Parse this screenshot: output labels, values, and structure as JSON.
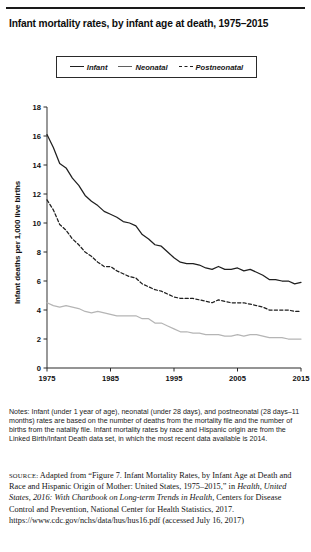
{
  "figure": {
    "title": "Infant mortality rates, by infant age at death, 1975–2015",
    "ylabel": "Infant deaths per 1,000 live births"
  },
  "legend": {
    "items": [
      {
        "label": "Infant",
        "style": "solid",
        "color": "#1f1f1f"
      },
      {
        "label": "Neonatal",
        "style": "solid",
        "color": "#5f5f5f"
      },
      {
        "label": "Postneonatal",
        "style": "dashed",
        "color": "#1f1f1f"
      }
    ]
  },
  "notes": {
    "text": "Notes: Infant (under 1 year of age), neonatal (under 28 days), and postneonatal (28 days–11 months) rates are based on the number of deaths from the mortality file and the number of births from the natality file. Infant mortality rates by race and Hispanic origin are from the Linked Birth/Infant Death data set, in which the most recent data available is 2014."
  },
  "source": {
    "label": "SOURCE:",
    "part1": " Adapted from “Figure 7. Infant Mortality Rates, by Infant Age at Death and Race and Hispanic Origin of Mother: United States, 1975–2015,” in ",
    "italic1": "Health, United States, 2016: With Chartbook on Long-term Trends in Health,",
    "part2": " Centers for Disease Control and Prevention, National Center for Health Statistics, 2017. https://www.cdc.gov/nchs/data/hus/hus16.pdf (accessed July 16, 2017)"
  },
  "chart_data": {
    "type": "line",
    "title": "Infant mortality rates, by infant age at death, 1975–2015",
    "xlabel": "",
    "ylabel": "Infant deaths per 1,000 live births",
    "xlim": [
      1975,
      2015
    ],
    "ylim": [
      0,
      18
    ],
    "ytick_labels": [
      "0",
      "2",
      "4",
      "6",
      "8",
      "10",
      "12",
      "14",
      "16",
      "18"
    ],
    "yticks": [
      0,
      2,
      4,
      6,
      8,
      10,
      12,
      14,
      16,
      18
    ],
    "xtick_labels": [
      "1975",
      "1985",
      "1995",
      "2005",
      "2015"
    ],
    "xticks": [
      1975,
      1985,
      1995,
      2005,
      2015
    ],
    "grid": false,
    "legend_position": "top-center",
    "x": [
      1975,
      1976,
      1977,
      1978,
      1979,
      1980,
      1981,
      1982,
      1983,
      1984,
      1985,
      1986,
      1987,
      1988,
      1989,
      1990,
      1991,
      1992,
      1993,
      1994,
      1995,
      1996,
      1997,
      1998,
      1999,
      2000,
      2001,
      2002,
      2003,
      2004,
      2005,
      2006,
      2007,
      2008,
      2009,
      2010,
      2011,
      2012,
      2013,
      2014,
      2015
    ],
    "series": [
      {
        "name": "Infant",
        "style": "solid",
        "color": "#1f1f1f",
        "values": [
          16.1,
          15.2,
          14.1,
          13.8,
          13.1,
          12.6,
          11.9,
          11.5,
          11.2,
          10.8,
          10.6,
          10.4,
          10.1,
          10.0,
          9.8,
          9.2,
          8.9,
          8.5,
          8.4,
          8.0,
          7.6,
          7.3,
          7.2,
          7.2,
          7.1,
          6.9,
          6.8,
          7.0,
          6.8,
          6.8,
          6.9,
          6.7,
          6.8,
          6.6,
          6.4,
          6.1,
          6.1,
          6.0,
          6.0,
          5.8,
          5.9
        ]
      },
      {
        "name": "Neonatal",
        "style": "dashed",
        "color": "#1f1f1f",
        "values": [
          11.6,
          10.9,
          9.9,
          9.5,
          8.9,
          8.5,
          8.0,
          7.7,
          7.3,
          7.0,
          7.0,
          6.7,
          6.5,
          6.3,
          6.2,
          5.8,
          5.6,
          5.4,
          5.3,
          5.1,
          4.9,
          4.8,
          4.8,
          4.8,
          4.7,
          4.6,
          4.5,
          4.7,
          4.6,
          4.5,
          4.5,
          4.5,
          4.4,
          4.3,
          4.2,
          4.0,
          4.0,
          4.0,
          4.0,
          3.9,
          3.9
        ]
      },
      {
        "name": "Postneonatal",
        "style": "solid",
        "color": "#b5b5b5",
        "values": [
          4.5,
          4.3,
          4.2,
          4.3,
          4.2,
          4.1,
          3.9,
          3.8,
          3.9,
          3.8,
          3.7,
          3.6,
          3.6,
          3.6,
          3.6,
          3.4,
          3.4,
          3.1,
          3.1,
          2.9,
          2.7,
          2.5,
          2.5,
          2.4,
          2.4,
          2.3,
          2.3,
          2.3,
          2.2,
          2.2,
          2.3,
          2.2,
          2.3,
          2.3,
          2.2,
          2.1,
          2.1,
          2.1,
          2.0,
          2.0,
          2.0
        ]
      }
    ]
  }
}
